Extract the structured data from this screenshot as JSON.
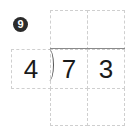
{
  "problem": {
    "number": "9",
    "divisor": "4",
    "dividend_digits": [
      "7",
      "3"
    ],
    "quotient_digits": [
      "",
      ""
    ],
    "work_digits": [
      "",
      ""
    ]
  }
}
